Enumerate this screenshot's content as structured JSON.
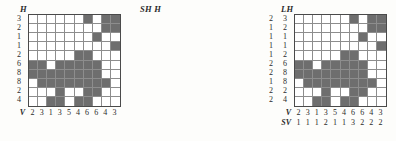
{
  "figure": {
    "type": "nonogram-triptych",
    "grid_size": 10,
    "fill_color": "#6e6e6e",
    "empty_color": "#ffffff",
    "line_color": "#8d8d8d"
  },
  "grid": [
    [
      0,
      0,
      0,
      0,
      0,
      0,
      1,
      0,
      1,
      1
    ],
    [
      0,
      0,
      0,
      0,
      0,
      0,
      0,
      0,
      1,
      1
    ],
    [
      0,
      0,
      0,
      0,
      0,
      0,
      0,
      1,
      0,
      0
    ],
    [
      0,
      0,
      0,
      0,
      0,
      0,
      0,
      0,
      0,
      1
    ],
    [
      0,
      0,
      0,
      0,
      0,
      1,
      1,
      0,
      0,
      0
    ],
    [
      1,
      1,
      0,
      1,
      1,
      1,
      1,
      1,
      0,
      0
    ],
    [
      1,
      1,
      1,
      1,
      1,
      1,
      1,
      1,
      0,
      0
    ],
    [
      0,
      1,
      1,
      1,
      1,
      1,
      1,
      1,
      1,
      0
    ],
    [
      0,
      0,
      0,
      1,
      0,
      0,
      1,
      1,
      0,
      0
    ],
    [
      0,
      0,
      1,
      1,
      0,
      1,
      1,
      0,
      0,
      0
    ]
  ],
  "panels": [
    {
      "id": "h",
      "header": "H",
      "row_tag": "",
      "col_tag": "V",
      "row_clues": [
        [
          "3"
        ],
        [
          "2"
        ],
        [
          "1"
        ],
        [
          "1"
        ],
        [
          "2"
        ],
        [
          "6"
        ],
        [
          "8"
        ],
        [
          "8"
        ],
        [
          "2"
        ],
        [
          "4"
        ]
      ],
      "col_clues": [
        [
          "2"
        ],
        [
          "3"
        ],
        [
          "1"
        ],
        [
          "3"
        ],
        [
          "5"
        ],
        [
          "4"
        ],
        [
          "6"
        ],
        [
          "6"
        ],
        [
          "4"
        ],
        [
          "3"
        ]
      ]
    },
    {
      "id": "sh",
      "header": "SH  H",
      "row_tag": "",
      "col_tag": "V",
      "col_tag2": "SV",
      "row_clues": [
        [
          "2",
          "3"
        ],
        [
          "1",
          "2"
        ],
        [
          "1",
          "1"
        ],
        [
          "1",
          "1"
        ],
        [
          "1",
          "2"
        ],
        [
          "2",
          "6"
        ],
        [
          "2",
          "8"
        ],
        [
          "1",
          "8"
        ],
        [
          "2",
          "2"
        ],
        [
          "2",
          "4"
        ]
      ],
      "col_clues": [
        [
          "2"
        ],
        [
          "3"
        ],
        [
          "1"
        ],
        [
          "3"
        ],
        [
          "5"
        ],
        [
          "4"
        ],
        [
          "6"
        ],
        [
          "6"
        ],
        [
          "4"
        ],
        [
          "3"
        ]
      ],
      "col_clues2": [
        [
          "1"
        ],
        [
          "1"
        ],
        [
          "1"
        ],
        [
          "2"
        ],
        [
          "1"
        ],
        [
          "1"
        ],
        [
          "3"
        ],
        [
          "2"
        ],
        [
          "2"
        ],
        [
          "2"
        ]
      ]
    },
    {
      "id": "lh",
      "header": "LH",
      "row_tag": "",
      "col_tag": "LV",
      "row_clues": [
        [
          "1",
          "2"
        ],
        [
          "2"
        ],
        [
          "1"
        ],
        [
          "1"
        ],
        [
          "2"
        ],
        [
          "2",
          "4"
        ],
        [
          "2",
          "6"
        ],
        [
          "8"
        ],
        [
          "1",
          "1"
        ],
        [
          "2",
          "2"
        ]
      ],
      "col_clues": [
        [
          "2"
        ],
        [
          "3"
        ],
        [
          "1"
        ],
        [
          "2",
          "1"
        ],
        [
          "5"
        ],
        [
          "4"
        ],
        [
          "1",
          "4",
          "1"
        ],
        [
          "1",
          "5"
        ],
        [
          "2",
          "2"
        ],
        [
          "2",
          "1"
        ]
      ]
    }
  ]
}
